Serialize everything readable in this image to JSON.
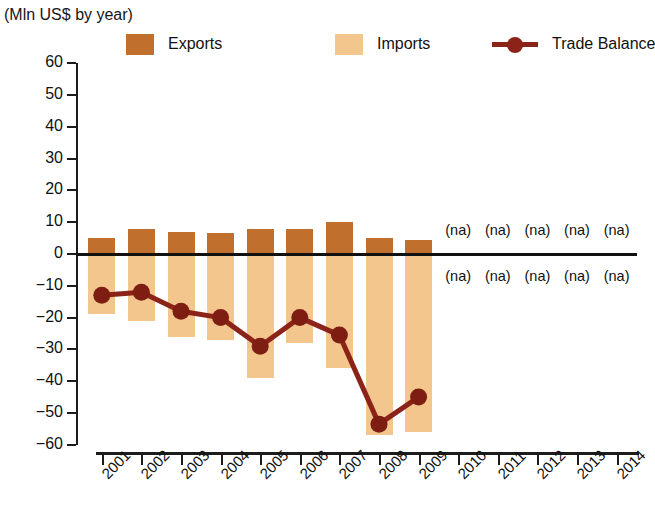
{
  "title": {
    "main": "",
    "sub": "(Mln US$ by year)"
  },
  "legend": {
    "position": "top",
    "items": [
      {
        "name": "Exports",
        "color": "#C0702C",
        "type": "bar"
      },
      {
        "name": "Imports",
        "color": "#F2C68C",
        "type": "bar"
      },
      {
        "name": "Trade Balance",
        "color": "#8B2318",
        "type": "line"
      }
    ]
  },
  "chart_data": {
    "type": "bar",
    "title": "",
    "subtitle": "(Mln US$ by year)",
    "xlabel": "",
    "ylabel": "",
    "unit": "Mln US$",
    "grid": false,
    "legend_position": "top",
    "ylim": [
      -60,
      60
    ],
    "yticks": [
      60,
      50,
      40,
      30,
      20,
      10,
      0,
      -10,
      -20,
      -30,
      -40,
      -50,
      -60
    ],
    "ytick_labels": [
      "60",
      "50",
      "40",
      "30",
      "20",
      "10",
      "0",
      "−10",
      "−20",
      "−30",
      "−40",
      "−50",
      "−60"
    ],
    "categories": [
      "2001",
      "2002",
      "2003",
      "2004",
      "2005",
      "2006",
      "2007",
      "2008",
      "2009",
      "2010",
      "2011",
      "2012",
      "2013",
      "2014"
    ],
    "series": [
      {
        "name": "Exports",
        "color": "#C0702C",
        "values": [
          5,
          8,
          7,
          6.5,
          8,
          8,
          10,
          5,
          4.5,
          null,
          null,
          null,
          null,
          null
        ]
      },
      {
        "name": "Imports",
        "color": "#F2C68C",
        "values": [
          -19,
          -21,
          -26,
          -27,
          -39,
          -28,
          -36,
          -57,
          -56,
          null,
          null,
          null,
          null,
          null
        ]
      },
      {
        "name": "Trade Balance",
        "color": "#8B2318",
        "type": "line",
        "values": [
          -13,
          -12,
          -18,
          -20,
          -29,
          -20,
          -25.5,
          -53.5,
          -45,
          null,
          null,
          null,
          null,
          null
        ]
      }
    ],
    "missing_label": "(na)",
    "missing_years": [
      "2010",
      "2011",
      "2012",
      "2013",
      "2014"
    ],
    "annotations": [
      {
        "text": "(na)",
        "year": "2010",
        "row": "upper"
      },
      {
        "text": "(na)",
        "year": "2011",
        "row": "upper"
      },
      {
        "text": "(na)",
        "year": "2012",
        "row": "upper"
      },
      {
        "text": "(na)",
        "year": "2013",
        "row": "upper"
      },
      {
        "text": "(na)",
        "year": "2014",
        "row": "upper"
      },
      {
        "text": "(na)",
        "year": "2010",
        "row": "lower"
      },
      {
        "text": "(na)",
        "year": "2011",
        "row": "lower"
      },
      {
        "text": "(na)",
        "year": "2012",
        "row": "lower"
      },
      {
        "text": "(na)",
        "year": "2013",
        "row": "lower"
      },
      {
        "text": "(na)",
        "year": "2014",
        "row": "lower"
      }
    ]
  }
}
